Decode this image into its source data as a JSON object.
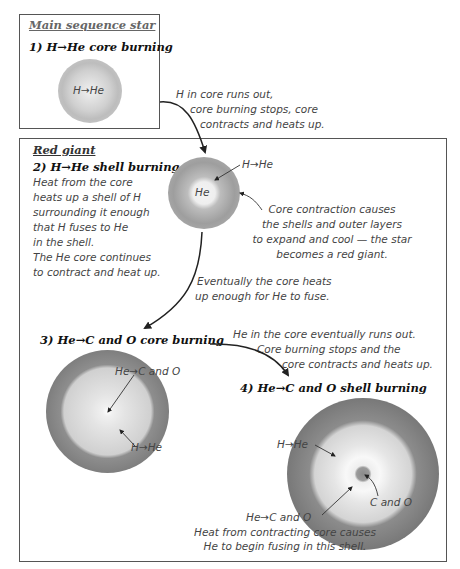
{
  "main_sequence": {
    "section_title": "Main sequence star",
    "stage_title": "1) H→He core burning",
    "core_label": "H→He"
  },
  "transition_1": {
    "lines": [
      "H in core runs out,",
      "core burning stops, core",
      "contracts and heats up."
    ]
  },
  "red_giant": {
    "section_title": "Red giant",
    "stage2": {
      "title": "2) H→He shell burning",
      "description": [
        "Heat from the core",
        "heats up a shell of H",
        "surrounding it enough",
        "that H fuses to He",
        "in the shell.",
        "The He core continues",
        "to contract and heat up."
      ],
      "shell_label": "H→He",
      "core_label": "He",
      "expansion_note": [
        "Core contraction causes",
        "the shells and outer layers",
        "to expand and cool — the star",
        "becomes a red giant."
      ]
    },
    "transition_2": {
      "lines": [
        "Eventually the core heats",
        "up enough for He to fuse."
      ]
    },
    "stage3": {
      "title": "3) He→C and O core burning",
      "core_label": "He→C and O",
      "shell_label": "H→He"
    },
    "transition_3": {
      "lines": [
        "He in the core eventually runs out.",
        "Core burning stops and the",
        "core contracts and heats up."
      ]
    },
    "stage4": {
      "title": "4) He→C and O shell burning",
      "outer_shell_label": "H→He",
      "core_label": "C and O",
      "inner_shell_label": "He→C and O",
      "caption": [
        "Heat from contracting core causes",
        "He to begin fusing in this shell."
      ]
    }
  },
  "colors": {
    "box_border": "#555555",
    "arrow": "#222222",
    "shell_dark": "#8a8a8a",
    "shell_light": "#d8d8d8",
    "core_light": "#f4f4f4"
  }
}
